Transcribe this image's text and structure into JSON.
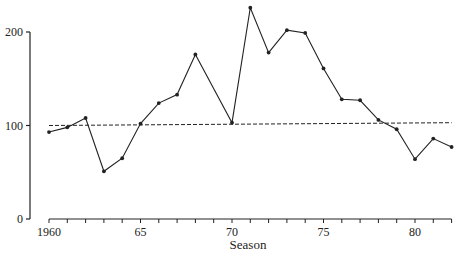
{
  "chart_data": {
    "type": "line",
    "title": "",
    "xlabel": "Season",
    "ylabel": "",
    "xlim": [
      1960,
      1982
    ],
    "ylim": [
      0,
      200
    ],
    "grid": false,
    "legend": null,
    "x_ticks": [
      1960,
      1965,
      1970,
      1975,
      1980
    ],
    "x_tick_labels": [
      "1960",
      "65",
      "70",
      "75",
      "80"
    ],
    "x_minor_ticks_every": 1,
    "y_ticks": [
      0,
      100,
      200
    ],
    "y_tick_labels": [
      "0",
      "100",
      "200"
    ],
    "series": [
      {
        "name": "Index",
        "style": "solid-with-markers",
        "color": "#222222",
        "x": [
          1960,
          1961,
          1962,
          1963,
          1964,
          1965,
          1966,
          1967,
          1968,
          1970,
          1971,
          1972,
          1973,
          1974,
          1975,
          1976,
          1977,
          1978,
          1979,
          1980,
          1981,
          1982
        ],
        "values": [
          93,
          98,
          108,
          51,
          65,
          102,
          124,
          133,
          176,
          103,
          226,
          178,
          202,
          199,
          161,
          128,
          127,
          106,
          96,
          64,
          86,
          77
        ]
      },
      {
        "name": "Trend",
        "style": "dashed",
        "color": "#222222",
        "x": [
          1960,
          1982
        ],
        "values": [
          100,
          103
        ]
      }
    ]
  }
}
